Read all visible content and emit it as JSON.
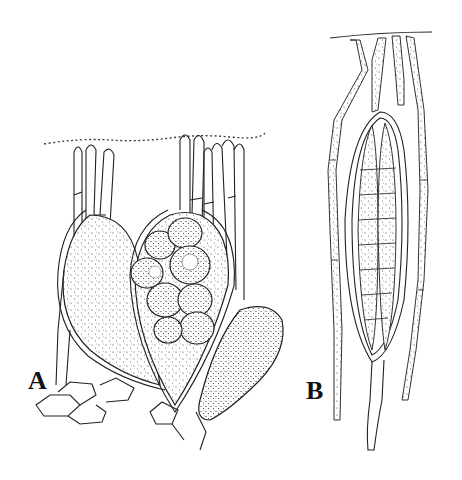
{
  "figure": {
    "panels": [
      {
        "id": "A",
        "label": "A",
        "description": "Two ovoid stippled asci/structures with filamentous paraphyses, one containing clustered spores"
      },
      {
        "id": "B",
        "label": "B",
        "description": "Elongated ascus with septate spores surrounded by septate stippled paraphyses"
      }
    ],
    "colors": {
      "ink": "#222222",
      "background": "#ffffff"
    }
  }
}
